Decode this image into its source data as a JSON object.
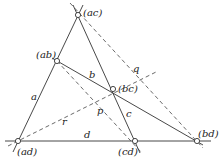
{
  "diagram": {
    "type": "complete-quadrilateral",
    "colors": {
      "solid": "#333333",
      "dashed": "#444444",
      "point_fill": "#ffffff"
    },
    "points": [
      {
        "id": "ac",
        "label": "(ac)",
        "x": 78,
        "y": 15
      },
      {
        "id": "ab",
        "label": "(ab)",
        "x": 57,
        "y": 61
      },
      {
        "id": "bc",
        "label": "(bc)",
        "x": 113,
        "y": 89
      },
      {
        "id": "ad",
        "label": "(ad)",
        "x": 18,
        "y": 141
      },
      {
        "id": "cd",
        "label": "(cd)",
        "x": 135,
        "y": 141
      },
      {
        "id": "bd",
        "label": "(bd)",
        "x": 197,
        "y": 141
      }
    ],
    "solid_lines": [
      {
        "label": "a",
        "through": [
          "ac",
          "ab",
          "ad"
        ]
      },
      {
        "label": "b",
        "through": [
          "ab",
          "bc",
          "bd"
        ]
      },
      {
        "label": "c",
        "through": [
          "ac",
          "bc",
          "cd"
        ]
      },
      {
        "label": "d",
        "through": [
          "ad",
          "cd",
          "bd"
        ]
      }
    ],
    "dashed_lines": [
      {
        "label": "p",
        "through": [
          "ab",
          "cd"
        ]
      },
      {
        "label": "q",
        "through": [
          "ac",
          "bd"
        ]
      },
      {
        "label": "r",
        "through": [
          "ad",
          "bc"
        ]
      }
    ],
    "labels": {
      "ac": "(ac)",
      "ab": "(ab)",
      "bc": "(bc)",
      "ad": "(ad)",
      "cd": "(cd)",
      "bd": "(bd)",
      "a": "a",
      "b": "b",
      "c": "c",
      "d": "d",
      "p": "p",
      "q": "q",
      "r": "r"
    }
  }
}
